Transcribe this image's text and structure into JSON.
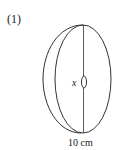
{
  "problem": {
    "number_label": "(1)"
  },
  "figure": {
    "shape": "cylinder (disc) with small hole",
    "variable_label": "x",
    "dimension_label": "10 cm",
    "stroke_color": "#333333",
    "background_color": "#ffffff"
  }
}
